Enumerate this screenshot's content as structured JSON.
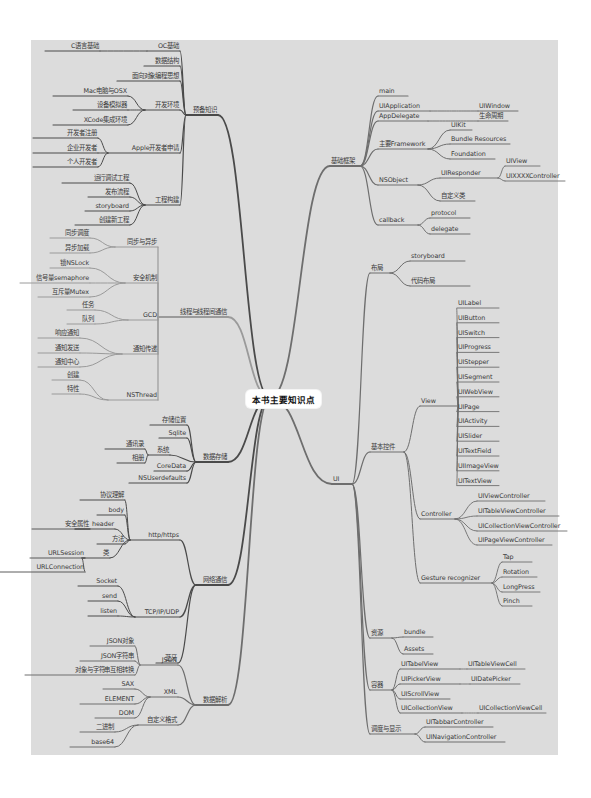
{
  "root": {
    "label": "本书主要知识点"
  },
  "colors": {
    "background": "#ffffff",
    "frame": "#dcdcdc",
    "dark_branch": "#4a4a4a",
    "light_branch": "#9a9a9a",
    "text": "#3a3a3a"
  },
  "left": [
    {
      "label": "预备知识",
      "children": [
        {
          "label": "OC基础",
          "children": [
            {
              "label": "C语言基础"
            }
          ]
        },
        {
          "label": "数据结构"
        },
        {
          "label": "面向对象编程思想"
        },
        {
          "label": "开发环境",
          "children": [
            {
              "label": "Mac电脑与OSX"
            },
            {
              "label": "设备模拟器"
            },
            {
              "label": "XCode集成环境"
            }
          ]
        },
        {
          "label": "Apple开发者申请",
          "children": [
            {
              "label": "开发者注册"
            },
            {
              "label": "企业开发者"
            },
            {
              "label": "个人开发者"
            }
          ]
        },
        {
          "label": "工程构建",
          "children": [
            {
              "label": "运行调试工程"
            },
            {
              "label": "发布流程"
            },
            {
              "label": "storyboard"
            },
            {
              "label": "创建新工程"
            }
          ]
        }
      ]
    },
    {
      "label": "线程与线程间通信",
      "children": [
        {
          "label": "同步与异步",
          "children": [
            {
              "label": "同步调度"
            },
            {
              "label": "异步加载"
            }
          ]
        },
        {
          "label": "安全机制",
          "children": [
            {
              "label": "锁NSLock"
            },
            {
              "label": "信号量semaphore"
            },
            {
              "label": "互斥量Mutex"
            }
          ]
        },
        {
          "label": "GCD",
          "children": [
            {
              "label": "任务"
            },
            {
              "label": "队列"
            }
          ]
        },
        {
          "label": "通知传递",
          "children": [
            {
              "label": "响应通知"
            },
            {
              "label": "通知发送"
            },
            {
              "label": "通知中心"
            }
          ]
        },
        {
          "label": "NSThread",
          "children": [
            {
              "label": "创建"
            },
            {
              "label": "特性"
            }
          ]
        }
      ]
    },
    {
      "label": "数据存储",
      "children": [
        {
          "label": "存储位置"
        },
        {
          "label": "Sqlite"
        },
        {
          "label": "系统",
          "children": [
            {
              "label": "通讯录"
            },
            {
              "label": "相册"
            }
          ]
        },
        {
          "label": "CoreData"
        },
        {
          "label": "NSUserdefaults"
        }
      ]
    },
    {
      "label": "网络通信",
      "children": [
        {
          "label": "http/https",
          "children": [
            {
              "label": "协议理解"
            },
            {
              "label": "body"
            },
            {
              "label": "header",
              "children": [
                {
                  "label": "安全属性"
                }
              ]
            },
            {
              "label": "方法"
            },
            {
              "label": "类",
              "children": [
                {
                  "label": "URLSession"
                },
                {
                  "label": "URLConnection"
                }
              ]
            }
          ]
        },
        {
          "label": "TCP/IP/UDP",
          "children": [
            {
              "label": "Socket"
            },
            {
              "label": "send"
            },
            {
              "label": "listen"
            }
          ]
        },
        {
          "label": "蓝牙"
        }
      ]
    },
    {
      "label": "数据解析",
      "children": [
        {
          "label": "JSON",
          "children": [
            {
              "label": "JSON对象"
            },
            {
              "label": "JSON字符串"
            },
            {
              "label": "对象与字符串互相转换"
            }
          ]
        },
        {
          "label": "XML",
          "children": [
            {
              "label": "SAX"
            },
            {
              "label": "ELEMENT"
            },
            {
              "label": "DOM"
            }
          ]
        },
        {
          "label": "自定义格式",
          "children": [
            {
              "label": "二进制"
            },
            {
              "label": "base64"
            }
          ]
        }
      ]
    }
  ],
  "right": [
    {
      "label": "基础框架",
      "children": [
        {
          "label": "main"
        },
        {
          "label": "UIApplication",
          "children": [
            {
              "label": "UIWindow"
            }
          ]
        },
        {
          "label": "AppDelegate",
          "children": [
            {
              "label": "生命周期"
            }
          ]
        },
        {
          "label": "主要Framework",
          "children": [
            {
              "label": "UIKit"
            },
            {
              "label": "Bundle Resources"
            },
            {
              "label": "Foundation"
            }
          ]
        },
        {
          "label": "NSObject",
          "children": [
            {
              "label": "UIResponder",
              "children": [
                {
                  "label": "UIView"
                },
                {
                  "label": "UIXXXXController"
                }
              ]
            },
            {
              "label": "自定义类"
            }
          ]
        },
        {
          "label": "callback",
          "children": [
            {
              "label": "protocol"
            },
            {
              "label": "delegate"
            }
          ]
        }
      ]
    },
    {
      "label": "UI",
      "children": [
        {
          "label": "布局",
          "children": [
            {
              "label": "storyboard",
              "children": [
                {
                  "label": "位置"
                },
                {
                  "label": "Constrain"
                }
              ]
            },
            {
              "label": "代码布局",
              "children": [
                {
                  "label": "相对位置"
                },
                {
                  "label": "动态添加约束"
                }
              ]
            }
          ]
        },
        {
          "label": "基本控件",
          "children": [
            {
              "label": "View",
              "children": [
                {
                  "label": "UILabel"
                },
                {
                  "label": "UIButton"
                },
                {
                  "label": "UISwitch"
                },
                {
                  "label": "UIProgress"
                },
                {
                  "label": "UIStepper"
                },
                {
                  "label": "UISegment"
                },
                {
                  "label": "UIWebView"
                },
                {
                  "label": "UIPage"
                },
                {
                  "label": "UIActivity"
                },
                {
                  "label": "UISlider"
                },
                {
                  "label": "UITextField"
                },
                {
                  "label": "UIImageView"
                },
                {
                  "label": "UITextView"
                }
              ]
            },
            {
              "label": "Controller",
              "children": [
                {
                  "label": "UIViewController"
                },
                {
                  "label": "UITableViewController"
                },
                {
                  "label": "UICollectionViewController"
                },
                {
                  "label": "UIPageViewController"
                }
              ]
            },
            {
              "label": "Gesture recognizer",
              "children": [
                {
                  "label": "Tap"
                },
                {
                  "label": "Rotation"
                },
                {
                  "label": "LongPress"
                },
                {
                  "label": "Pinch"
                }
              ]
            }
          ]
        },
        {
          "label": "资源",
          "children": [
            {
              "label": "bundle"
            },
            {
              "label": "Assets"
            }
          ]
        },
        {
          "label": "容器",
          "children": [
            {
              "label": "UITabelView",
              "children": [
                {
                  "label": "UITableViewCell"
                }
              ]
            },
            {
              "label": "UIPickerView",
              "children": [
                {
                  "label": "UIDatePicker"
                }
              ]
            },
            {
              "label": "UIScrollView"
            },
            {
              "label": "UICollectionView",
              "children": [
                {
                  "label": "UICollectionViewCell"
                }
              ]
            }
          ]
        },
        {
          "label": "调度与显示",
          "children": [
            {
              "label": "UITabbarController"
            },
            {
              "label": "UINavigationController"
            }
          ]
        }
      ]
    }
  ]
}
